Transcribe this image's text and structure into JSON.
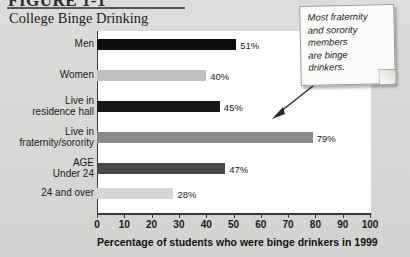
{
  "figure": {
    "number": "FIGURE 1-1",
    "title": "College Binge Drinking"
  },
  "callout": {
    "text": "Most fraternity\nand sorority\nmembers\nare binge\ndrinkers."
  },
  "chart_data": {
    "type": "bar",
    "orientation": "horizontal",
    "title": "College Binge Drinking",
    "xlabel": "Percentage of students who were binge drinkers in 1999",
    "ylabel": "",
    "xlim": [
      0,
      100
    ],
    "xticks": [
      0,
      10,
      20,
      30,
      40,
      50,
      60,
      70,
      80,
      90,
      100
    ],
    "grid": false,
    "legend": false,
    "categories": [
      "Men",
      "Women",
      "Live in\nresidence hall",
      "Live in\nfraternity/sorority",
      "AGE\nUnder 24",
      "24 and over"
    ],
    "values": [
      51,
      40,
      45,
      79,
      47,
      28
    ],
    "value_labels": [
      "51%",
      "40%",
      "45%",
      "79%",
      "47%",
      "28%"
    ],
    "bar_colors": [
      "#0d0d0d",
      "#bfbfbf",
      "#181818",
      "#8a8a8a",
      "#4a4a4a",
      "#d6d6d6"
    ],
    "annotation": "Most fraternity and sorority members are binge drinkers."
  },
  "colors": {
    "page_background": "#d9d9d7",
    "plot_background": "#ffffff",
    "axis": "#3a3a3a",
    "text": "#1a1a1a"
  }
}
